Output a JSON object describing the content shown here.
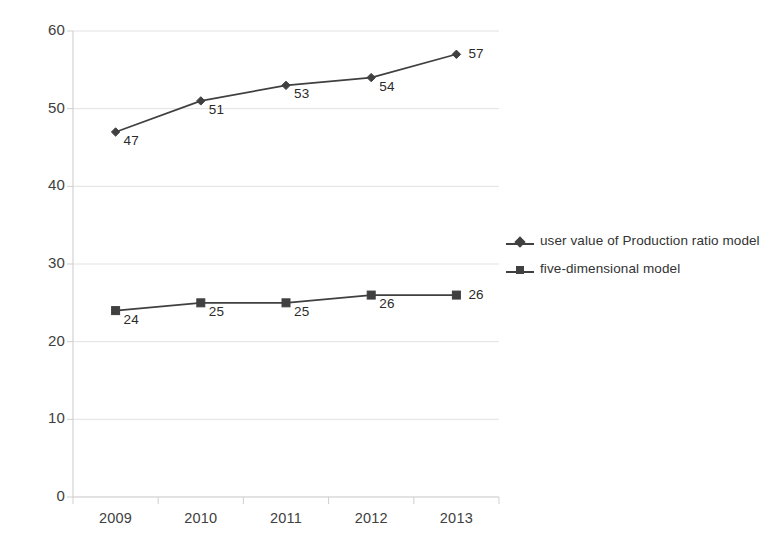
{
  "chart_data": {
    "type": "line",
    "title": "",
    "xlabel": "",
    "ylabel": "",
    "categories": [
      "2009",
      "2010",
      "2011",
      "2012",
      "2013"
    ],
    "ylim": [
      0,
      60
    ],
    "yticks": [
      0,
      10,
      20,
      30,
      40,
      50,
      60
    ],
    "ytick_labels": [
      "0",
      "10",
      "20",
      "30",
      "40",
      "50",
      "60"
    ],
    "grid": true,
    "legend_position": "right",
    "series": [
      {
        "name": "user value of Production ratio model",
        "marker": "diamond",
        "color": "#404040",
        "values": [
          47,
          51,
          53,
          54,
          57
        ],
        "data_labels": [
          "47",
          "51",
          "53",
          "54",
          "57"
        ]
      },
      {
        "name": "five-dimensional model",
        "marker": "square",
        "color": "#404040",
        "values": [
          24,
          25,
          25,
          26,
          26
        ],
        "data_labels": [
          "24",
          "25",
          "25",
          "26",
          "26"
        ]
      }
    ]
  },
  "legend": {
    "entries": [
      {
        "label": "user value of Production ratio model"
      },
      {
        "label": "five-dimensional model"
      }
    ]
  },
  "axes": {
    "y_labels": [
      "60",
      "50",
      "40",
      "30",
      "20",
      "10",
      "0"
    ],
    "x_labels": [
      "2009",
      "2010",
      "2011",
      "2012",
      "2013"
    ]
  }
}
